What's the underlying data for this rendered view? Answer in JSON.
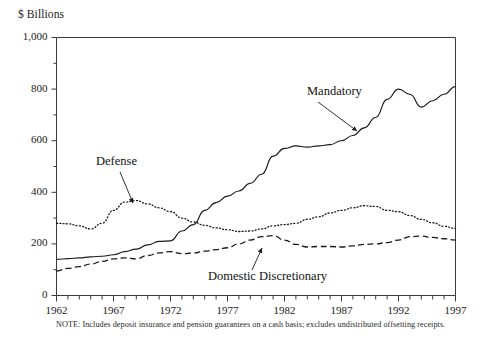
{
  "axis_unit_label": "$ Billions",
  "note": "NOTE:  Includes deposit insurance and pension guarantees on a cash basis; excludes undistributed offsetting receipts.",
  "colors": {
    "ink": "#1a1a1a",
    "frame": "#3a3a3a",
    "note": "#2a2a2a"
  },
  "annotations": [
    {
      "name": "mandatory",
      "label": "Mandatory",
      "text_x": 307,
      "text_y": 95,
      "arrow_x1": 318,
      "arrow_y1": 102,
      "arrow_x2": 357,
      "arrow_y2": 131
    },
    {
      "name": "defense",
      "label": "Defense",
      "text_x": 96,
      "text_y": 165,
      "arrow_x1": 120,
      "arrow_y1": 172,
      "arrow_x2": 133,
      "arrow_y2": 203
    },
    {
      "name": "domestic-discretionary",
      "label": "Domestic Discretionary",
      "text_x": 208,
      "text_y": 280,
      "arrow_x1": 252,
      "arrow_y1": 270,
      "arrow_x2": 262,
      "arrow_y2": 248
    }
  ],
  "chart_data": {
    "type": "line",
    "title": "",
    "subtitle": "",
    "xlabel": "",
    "ylabel": "$ Billions",
    "ylim": [
      0,
      1000
    ],
    "xlim": [
      1962,
      1997
    ],
    "ytick_major": [
      0,
      200,
      400,
      600,
      800,
      1000
    ],
    "ytick_major_labels": [
      "0",
      "200",
      "400",
      "600",
      "800",
      "1,000"
    ],
    "ytick_minor": [
      100,
      300,
      500,
      700,
      900
    ],
    "xtick_all": [
      1962,
      1963,
      1964,
      1965,
      1966,
      1967,
      1968,
      1969,
      1970,
      1971,
      1972,
      1973,
      1974,
      1975,
      1976,
      1977,
      1978,
      1979,
      1980,
      1981,
      1982,
      1983,
      1984,
      1985,
      1986,
      1987,
      1988,
      1989,
      1990,
      1991,
      1992,
      1993,
      1994,
      1995,
      1996,
      1997
    ],
    "xtick_labeled": [
      1962,
      1967,
      1972,
      1977,
      1982,
      1987,
      1992,
      1997
    ],
    "xtick_labels": [
      "1962",
      "1967",
      "1972",
      "1977",
      "1982",
      "1987",
      "1992",
      "1997"
    ],
    "grid": false,
    "legend_position": "inline-annotations",
    "x": [
      1962,
      1963,
      1964,
      1965,
      1966,
      1967,
      1968,
      1969,
      1970,
      1971,
      1972,
      1973,
      1974,
      1975,
      1976,
      1977,
      1978,
      1979,
      1980,
      1981,
      1982,
      1983,
      1984,
      1985,
      1986,
      1987,
      1988,
      1989,
      1990,
      1991,
      1992,
      1993,
      1994,
      1995,
      1996,
      1997
    ],
    "series": [
      {
        "name": "Mandatory",
        "style": "solid",
        "values": [
          140,
          143,
          146,
          150,
          152,
          158,
          170,
          180,
          196,
          210,
          212,
          250,
          275,
          330,
          360,
          385,
          405,
          435,
          470,
          540,
          570,
          580,
          575,
          580,
          585,
          600,
          620,
          650,
          690,
          760,
          800,
          780,
          730,
          755,
          780,
          810
        ]
      },
      {
        "name": "Defense",
        "style": "dotted",
        "values": [
          280,
          278,
          270,
          258,
          280,
          330,
          362,
          368,
          355,
          340,
          325,
          300,
          285,
          272,
          262,
          255,
          248,
          250,
          258,
          270,
          275,
          280,
          295,
          305,
          320,
          330,
          340,
          348,
          345,
          330,
          325,
          310,
          295,
          282,
          268,
          260
        ]
      },
      {
        "name": "Domestic Discretionary",
        "style": "dashed",
        "values": [
          95,
          105,
          112,
          122,
          132,
          142,
          146,
          142,
          155,
          165,
          170,
          162,
          165,
          172,
          178,
          185,
          200,
          215,
          228,
          232,
          215,
          198,
          188,
          190,
          190,
          188,
          192,
          198,
          200,
          205,
          215,
          228,
          230,
          225,
          220,
          215
        ]
      }
    ]
  }
}
